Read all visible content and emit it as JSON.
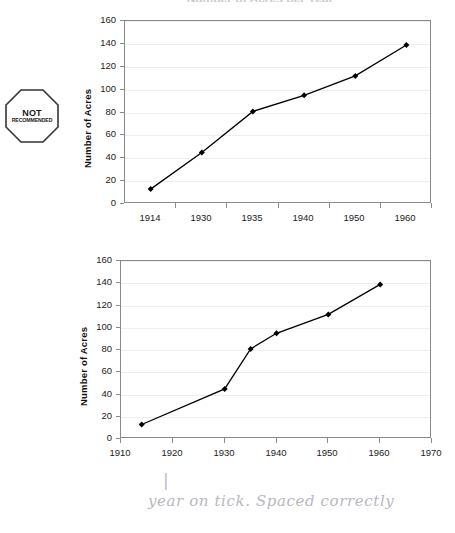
{
  "badge": {
    "line1": "NOT",
    "line2": "RECOMMENDED",
    "shape": "octagon-stop-sign",
    "color": "#1a1a1a"
  },
  "cut_off_title": "Number of Acres per Year",
  "annotation": {
    "tick_stroke": "|",
    "note": "year on tick. Spaced correctly",
    "color": "#b8b8c0"
  },
  "chart_data": [
    {
      "id": "chart-top-category-axis",
      "type": "line",
      "title": "",
      "xlabel": "",
      "ylabel": "Number of Acres",
      "axis_kind": "category",
      "categories": [
        "1914",
        "1930",
        "1935",
        "1940",
        "1950",
        "1960"
      ],
      "values": [
        13,
        45,
        81,
        95,
        112,
        139
      ],
      "ytick_labels": [
        "0",
        "20",
        "40",
        "60",
        "80",
        "100",
        "120",
        "140",
        "160"
      ],
      "yticks": [
        0,
        20,
        40,
        60,
        80,
        100,
        120,
        140,
        160
      ],
      "ylim": [
        0,
        160
      ],
      "grid": true,
      "legend": "none",
      "marker": "diamond",
      "line_color": "#000000",
      "marker_color": "#000000",
      "status": "NOT RECOMMENDED"
    },
    {
      "id": "chart-bottom-numeric-axis",
      "type": "line",
      "title": "",
      "xlabel": "",
      "ylabel": "Number of Acres",
      "axis_kind": "numeric",
      "x": [
        1914,
        1930,
        1935,
        1940,
        1950,
        1960
      ],
      "values": [
        13,
        45,
        81,
        95,
        112,
        139
      ],
      "xtick_labels": [
        "1910",
        "1920",
        "1930",
        "1940",
        "1950",
        "1960",
        "1970"
      ],
      "xticks": [
        1910,
        1920,
        1930,
        1940,
        1950,
        1960,
        1970
      ],
      "xlim": [
        1910,
        1970
      ],
      "ytick_labels": [
        "0",
        "20",
        "40",
        "60",
        "80",
        "100",
        "120",
        "140",
        "160"
      ],
      "yticks": [
        0,
        20,
        40,
        60,
        80,
        100,
        120,
        140,
        160
      ],
      "ylim": [
        0,
        160
      ],
      "grid": true,
      "legend": "none",
      "marker": "diamond",
      "line_color": "#000000",
      "marker_color": "#000000",
      "status": "RECOMMENDED"
    }
  ]
}
